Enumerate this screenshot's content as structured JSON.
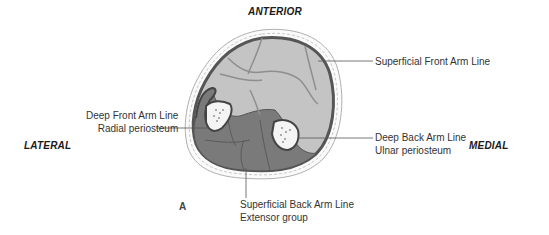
{
  "figure": {
    "panel_letter": "A",
    "orientation": {
      "top": "ANTERIOR",
      "left": "LATERAL",
      "right": "MEDIAL"
    },
    "callouts": [
      {
        "id": "sfal",
        "lines": [
          "Superficial Front Arm Line"
        ]
      },
      {
        "id": "dfal",
        "lines": [
          "Deep Front Arm Line",
          "Radial periosteum"
        ]
      },
      {
        "id": "dbal",
        "lines": [
          "Deep Back Arm Line",
          "Ulnar periosteum"
        ]
      },
      {
        "id": "sbal",
        "lines": [
          "Superficial Back Arm Line",
          "Extensor group"
        ]
      }
    ],
    "colors": {
      "skin_outline": "#8a8a8a",
      "fascia_ring": "#555555",
      "anterior_compartment": "#c4c4c4",
      "posterior_compartment": "#7a7a7a",
      "bone": "#f4f4f4",
      "leader_line": "#555555"
    }
  }
}
